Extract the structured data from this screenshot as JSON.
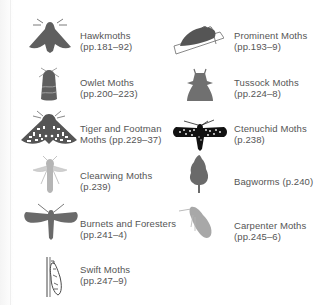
{
  "colors": {
    "icon_dark": "#5f5f5f",
    "icon_mid": "#7a7a7a",
    "icon_light": "#b5b5b5",
    "icon_black": "#111111",
    "text": "#555555"
  },
  "families": [
    {
      "name": "Hawkmoths",
      "pages": "(pp.181–92)",
      "icon": "hawkmoth-icon"
    },
    {
      "name": "Prominent Moths",
      "pages": "(pp.193–9)",
      "icon": "prominent-moth-icon"
    },
    {
      "name": "Owlet Moths",
      "pages": "(pp.200–223)",
      "icon": "owlet-moth-icon"
    },
    {
      "name": "Tussock Moths",
      "pages": "(pp.224–8)",
      "icon": "tussock-moth-icon"
    },
    {
      "name": "Tiger and Footman",
      "pages": "Moths (pp.229–37)",
      "icon": "tiger-moth-icon"
    },
    {
      "name": "Ctenuchid Moths",
      "pages": "(p.238)",
      "icon": "ctenuchid-moth-icon"
    },
    {
      "name": "Clearwing Moths",
      "pages": "(p.239)",
      "icon": "clearwing-moth-icon"
    },
    {
      "name": "Bagworms (p.240)",
      "pages": "",
      "icon": "bagworm-icon"
    },
    {
      "name": "Burnets and Foresters",
      "pages": "(pp.241–4)",
      "icon": "burnet-moth-icon"
    },
    {
      "name": "Carpenter Moths",
      "pages": "(pp.245–6)",
      "icon": "carpenter-moth-icon"
    },
    {
      "name": "Swift Moths",
      "pages": "(pp.247–9)",
      "icon": "swift-moth-icon"
    }
  ]
}
